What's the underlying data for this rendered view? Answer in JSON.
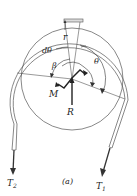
{
  "figure": {
    "caption": "(a)",
    "labels": {
      "r": "r",
      "dtheta": "dθ",
      "beta": "β",
      "theta": "θ",
      "M": "M",
      "R": "R",
      "T1": "T",
      "T1_sub": "1",
      "T2": "T",
      "T2_sub": "2"
    },
    "colors": {
      "line": "#333333",
      "background": "#ffffff"
    }
  }
}
